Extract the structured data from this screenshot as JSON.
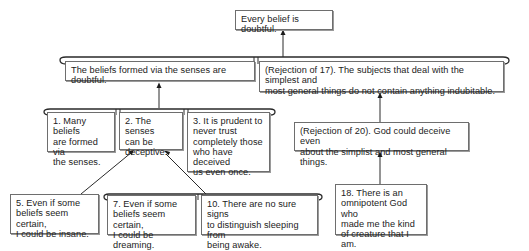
{
  "diagram": {
    "type": "argument-map",
    "conclusion": {
      "id": "root",
      "text": "Every belief is doubtful."
    },
    "level1": [
      {
        "id": "senses-doubtful",
        "text": "The beliefs formed via the senses are doubtful."
      },
      {
        "id": "rejection-17",
        "text": "(Rejection of 17). The subjects that deal with the simplest and\nmost general things do not contain anything indubitable."
      }
    ],
    "level2_left": [
      {
        "id": "premise-1",
        "text": "1. Many beliefs\nare formed via\nthe senses."
      },
      {
        "id": "premise-2",
        "text": "2. The senses\ncan be\ndeceptive."
      },
      {
        "id": "premise-3",
        "text": "3. It is prudent to\nnever trust\ncompletely those\nwho have deceived\nus even once."
      }
    ],
    "level2_right": {
      "id": "rejection-20",
      "text": "(Rejection of 20). God could deceive even\nabout the simplist  and most general things."
    },
    "level3_left": [
      {
        "id": "premise-5",
        "text": "5. Even if some\nbeliefs seem certain,\nI could be insane."
      },
      {
        "id": "premise-7",
        "text": "7. Even if some\nbeliefs seem certain,\nI could be dreaming."
      },
      {
        "id": "premise-10",
        "text": "10. There are no sure signs\nto distinguish sleeping from\nbeing awake."
      }
    ],
    "level3_right": {
      "id": "premise-18",
      "text": "18. There is an\nomnipotent God who\nmade me the kind\nof creature that I am."
    },
    "colors": {
      "line": "#3a3a3a",
      "box_border": "#6e6e6e",
      "text": "#222222",
      "background": "#ffffff"
    },
    "connectors": [
      {
        "from": "senses-doubtful+rejection-17",
        "to": "root",
        "kind": "linked-arrow"
      },
      {
        "from": "premise-1+premise-2+premise-3",
        "to": "senses-doubtful",
        "kind": "linked-arrow"
      },
      {
        "from": "rejection-20",
        "to": "rejection-17",
        "kind": "arrow"
      },
      {
        "from": "premise-18",
        "to": "rejection-20",
        "kind": "arrow"
      },
      {
        "from": "premise-5",
        "to": "premise-2",
        "kind": "arrow"
      },
      {
        "from": "premise-7+premise-10",
        "to": "premise-2",
        "kind": "linked-arrow"
      }
    ]
  }
}
